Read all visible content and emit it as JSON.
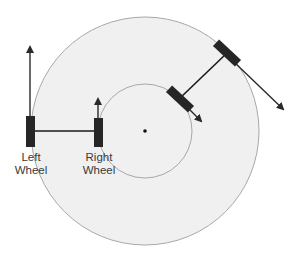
{
  "diagram": {
    "colors": {
      "background": "#ffffff",
      "disc_fill": "#f0f0f0",
      "circle_stroke": "#a8a8a8",
      "wheel": "#262626",
      "axle": "#1a1a1a",
      "arrow": "#2a2a2a",
      "center_dot": "#111111"
    },
    "outer_circle": {
      "cx": 145,
      "cy": 131,
      "r": 114
    },
    "inner_circle": {
      "cx": 145,
      "cy": 131,
      "r": 47
    },
    "center_point": {
      "cx": 145,
      "cy": 131
    },
    "left_wheel": {
      "label_line1": "Left",
      "label_line2": "Wheel"
    },
    "right_wheel": {
      "label_line1": "Right",
      "label_line2": "Wheel"
    }
  }
}
